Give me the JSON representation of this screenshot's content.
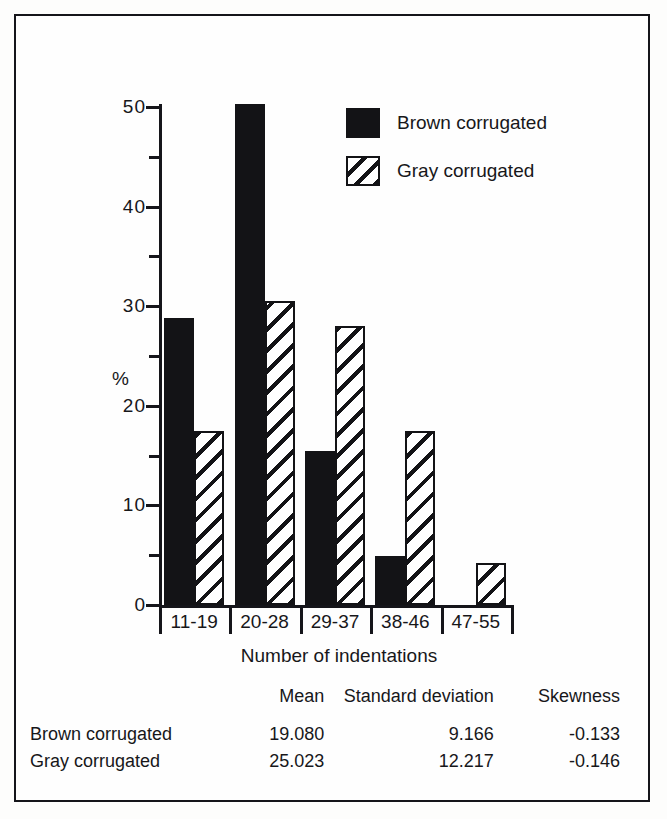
{
  "figure": {
    "frame": true
  },
  "chart_data": {
    "type": "bar",
    "title": "",
    "xlabel": "Number of indentations",
    "ylabel": "%",
    "categories": [
      "11-19",
      "20-28",
      "29-37",
      "38-46",
      "47-55"
    ],
    "series": [
      {
        "name": "Brown corrugated",
        "values": [
          28.8,
          50.3,
          15.5,
          4.9,
          0
        ],
        "fill": "solid-black",
        "color": "#131316"
      },
      {
        "name": "Gray corrugated",
        "values": [
          17.5,
          30.5,
          28.0,
          17.5,
          4.2
        ],
        "fill": "diagonal-hatch",
        "color": "#131316"
      }
    ],
    "ylim": [
      0,
      50
    ],
    "yticks": [
      0,
      10,
      20,
      30,
      40,
      50
    ],
    "ytick_labels": [
      "0",
      "10",
      "20",
      "30",
      "40",
      "50"
    ],
    "yminor_ticks": [
      5,
      15,
      25,
      35,
      45
    ],
    "grid": false,
    "legend_position": "top-right"
  },
  "legend": {
    "items": [
      {
        "label": "Brown corrugated",
        "swatch": "solid"
      },
      {
        "label": "Gray corrugated",
        "swatch": "hatch"
      }
    ]
  },
  "stats_table": {
    "headers": [
      "",
      "Mean",
      "Standard deviation",
      "Skewness"
    ],
    "rows": [
      {
        "name": "Brown corrugated",
        "mean": "19.080",
        "sd": "9.166",
        "skewness": "-0.133"
      },
      {
        "name": "Gray corrugated",
        "mean": "25.023",
        "sd": "12.217",
        "skewness": "-0.146"
      }
    ]
  }
}
